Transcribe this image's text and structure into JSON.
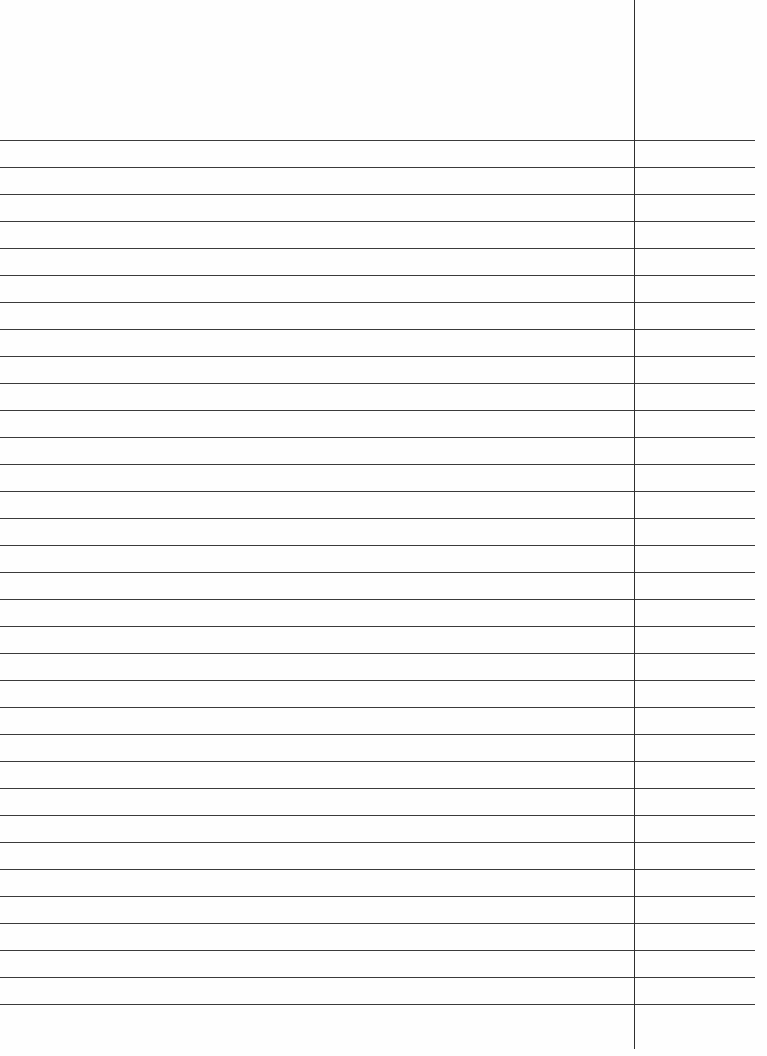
{
  "page": {
    "type": "lined-paper",
    "background_color": "#fefefe",
    "line_color": "#3a3a3a"
  },
  "ruling": {
    "first_line_y": 140,
    "line_spacing": 27,
    "line_count": 33,
    "line_start_x": 0,
    "line_end_x": 755
  },
  "margin_line": {
    "x": 634,
    "top": 0,
    "bottom": 1049
  }
}
